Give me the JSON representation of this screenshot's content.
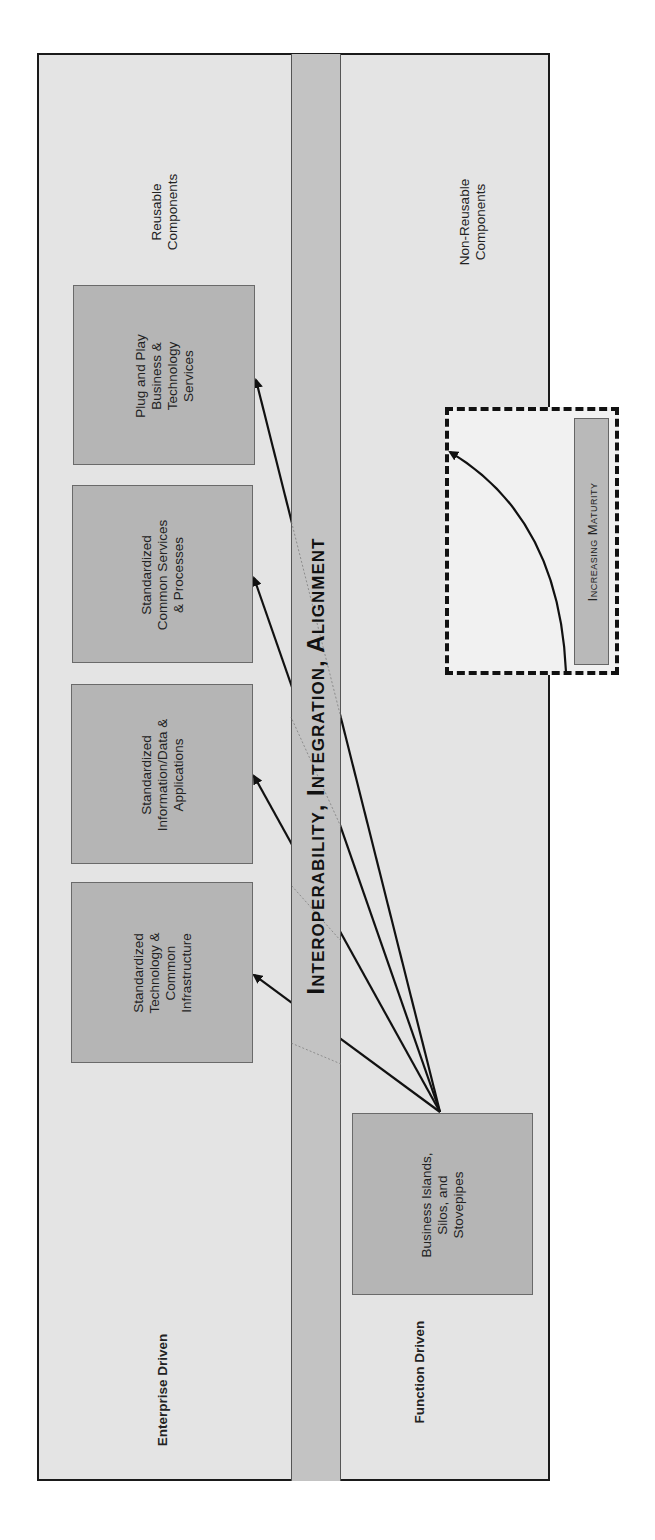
{
  "diagram": {
    "band_title": "Interoperability, Integration, Alignment",
    "axis_labels": {
      "top_left": "Reusable Components",
      "top_left_lines": [
        "Reusable",
        "Components"
      ],
      "top_right_lines": [
        "Non-Reusable",
        "Components"
      ],
      "bottom_left": "Enterprise Driven",
      "bottom_right": "Function Driven"
    },
    "target_boxes": [
      {
        "lines": [
          "Plug and Play",
          "Business &",
          "Technology",
          "Services"
        ]
      },
      {
        "lines": [
          "Standardized",
          "Common Services",
          "& Processes"
        ]
      },
      {
        "lines": [
          "Standardized",
          "Information/Data &",
          "Applications"
        ]
      },
      {
        "lines": [
          "Standardized",
          "Technology &",
          "Common",
          "Infrastructure"
        ]
      }
    ],
    "source_box": {
      "lines": [
        "Business Islands,",
        "Silos, and",
        "Stovepipes"
      ]
    },
    "legend": {
      "label": "Increasing Maturity"
    },
    "colors": {
      "background": "#e4e4e4",
      "band": "#c3c3c3",
      "box": "#b5b5b5",
      "border": "#1a1a1a",
      "arrow": "#111111"
    }
  }
}
